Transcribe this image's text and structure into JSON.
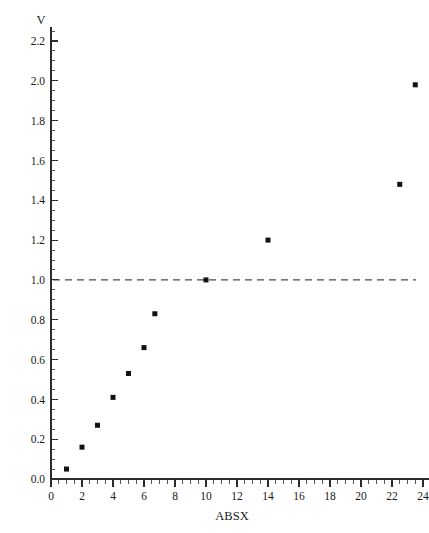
{
  "chart_data": {
    "type": "scatter",
    "title": "",
    "subtitle": "",
    "xlabel": "ABSX",
    "ylabel": "V",
    "xlim": [
      0,
      24
    ],
    "ylim": [
      0.0,
      2.2
    ],
    "x_major_step": 2,
    "y_major_step": 0.2,
    "x_minor_per_major": 4,
    "y_minor_per_major": 4,
    "grid": false,
    "legend": null,
    "legend_position": "none",
    "marker_shape": "square",
    "marker_color": "#111111",
    "marker_size_px": 5,
    "xtick_labels": [
      "0",
      "2",
      "4",
      "6",
      "8",
      "10",
      "12",
      "14",
      "16",
      "18",
      "20",
      "22",
      "24"
    ],
    "xtick_values": [
      0,
      2,
      4,
      6,
      8,
      10,
      12,
      14,
      16,
      18,
      20,
      22,
      24
    ],
    "ytick_labels": [
      "0.0",
      "0.2",
      "0.4",
      "0.6",
      "0.8",
      "1.0",
      "1.2",
      "1.4",
      "1.6",
      "1.8",
      "2.0",
      "2.2"
    ],
    "ytick_values": [
      0.0,
      0.2,
      0.4,
      0.6,
      0.8,
      1.0,
      1.2,
      1.4,
      1.6,
      1.8,
      2.0,
      2.2
    ],
    "x": [
      1.0,
      2.0,
      3.0,
      4.0,
      5.0,
      6.0,
      6.7,
      10.0,
      14.0,
      22.5,
      23.5
    ],
    "y": [
      0.05,
      0.16,
      0.27,
      0.41,
      0.53,
      0.66,
      0.83,
      1.0,
      1.2,
      1.48,
      1.98
    ],
    "points": [
      {
        "x": 1.0,
        "y": 0.05
      },
      {
        "x": 2.0,
        "y": 0.16
      },
      {
        "x": 3.0,
        "y": 0.27
      },
      {
        "x": 4.0,
        "y": 0.41
      },
      {
        "x": 5.0,
        "y": 0.53
      },
      {
        "x": 6.0,
        "y": 0.66
      },
      {
        "x": 6.7,
        "y": 0.83
      },
      {
        "x": 10.0,
        "y": 1.0
      },
      {
        "x": 14.0,
        "y": 1.2
      },
      {
        "x": 22.5,
        "y": 1.48
      },
      {
        "x": 23.5,
        "y": 1.98
      }
    ],
    "reference_lines": [
      {
        "orientation": "horizontal",
        "value": 1.0,
        "style": "dashed",
        "color": "#4a4a4a",
        "label": ""
      }
    ]
  }
}
